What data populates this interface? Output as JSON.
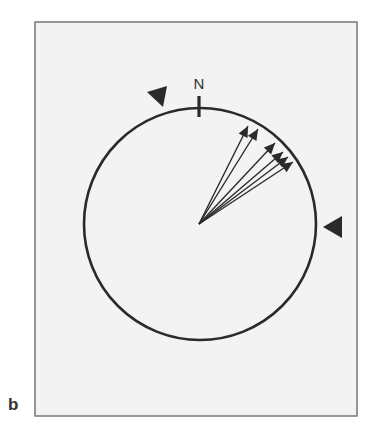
{
  "figure": {
    "panel_label": "b",
    "north_label": "N",
    "colors": {
      "background": "#f3f3f3",
      "frame": "#777777",
      "ink": "#2a2a2a"
    },
    "frame": {
      "x": 35,
      "y": 22,
      "width": 322,
      "height": 394
    },
    "compass_circle": {
      "cx": 200,
      "cy": 224,
      "r": 116
    },
    "north_tick": {
      "x": 199,
      "y1": 96,
      "y2": 117
    },
    "markers": [
      {
        "name": "top-left-triangle-marker",
        "points": "147,92 167,86 163,107"
      },
      {
        "name": "right-triangle-marker",
        "points": "323,227 342,216 342,238"
      }
    ],
    "vectors": {
      "origin": {
        "x": 199,
        "y": 224
      },
      "tips": [
        {
          "x": 248,
          "y": 126
        },
        {
          "x": 258,
          "y": 129
        },
        {
          "x": 275,
          "y": 143
        },
        {
          "x": 283,
          "y": 152
        },
        {
          "x": 288,
          "y": 157
        },
        {
          "x": 293,
          "y": 162
        }
      ]
    }
  }
}
